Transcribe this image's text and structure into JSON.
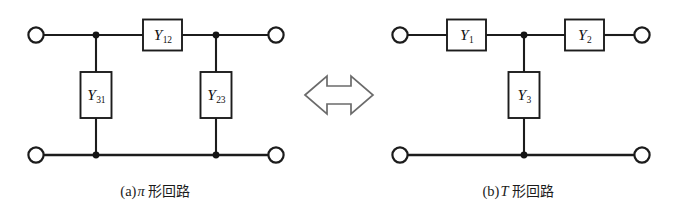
{
  "figure": {
    "kind": "circuit-equivalence-diagram",
    "background_color": "#ffffff",
    "line_color": "#1c1c1c",
    "arrow_outline_color": "#6b6b6b"
  },
  "equivalence_arrow": {
    "name": "double-headed-arrow",
    "direction": "bidirectional",
    "style": "hollow-outline"
  },
  "pi_circuit": {
    "caption_index": "(a)",
    "caption_symbol": "π",
    "caption_text": "形回路",
    "caption_full": "(a) π 形回路",
    "series_element": {
      "label_base": "Y",
      "label_sub": "12",
      "orientation": "horizontal"
    },
    "shunt_left_element": {
      "label_base": "Y",
      "label_sub": "31",
      "orientation": "vertical"
    },
    "shunt_right_element": {
      "label_base": "Y",
      "label_sub": "23",
      "orientation": "vertical"
    },
    "terminals": [
      "top-left",
      "top-right",
      "bottom-left",
      "bottom-right"
    ],
    "nodes": [
      "top-left-junction",
      "top-right-junction",
      "bottom-left-junction",
      "bottom-right-junction"
    ]
  },
  "t_circuit": {
    "caption_index": "(b)",
    "caption_symbol": "T",
    "caption_text": "形回路",
    "caption_full": "(b) T 形回路",
    "series_left_element": {
      "label_base": "Y",
      "label_sub": "1",
      "orientation": "horizontal"
    },
    "series_right_element": {
      "label_base": "Y",
      "label_sub": "2",
      "orientation": "horizontal"
    },
    "shunt_element": {
      "label_base": "Y",
      "label_sub": "3",
      "orientation": "vertical"
    },
    "terminals": [
      "top-left",
      "top-right",
      "bottom-left",
      "bottom-right"
    ],
    "nodes": [
      "top-center-junction",
      "bottom-center-junction"
    ]
  }
}
